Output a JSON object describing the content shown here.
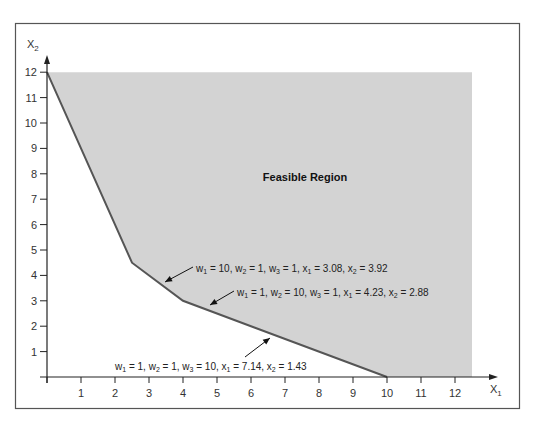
{
  "chart_data": {
    "type": "area",
    "title": "",
    "xlabel": "X1",
    "ylabel": "X2",
    "xlim": [
      0,
      12.5
    ],
    "ylim": [
      0,
      12
    ],
    "x_ticks": [
      1,
      2,
      3,
      4,
      5,
      6,
      7,
      8,
      9,
      10,
      11,
      12
    ],
    "y_ticks": [
      1,
      2,
      3,
      4,
      5,
      6,
      7,
      8,
      9,
      10,
      11,
      12
    ],
    "grid": false,
    "legend": null,
    "feasible_region": {
      "label": "Feasible Region",
      "boundary_vertices": [
        {
          "x": 0,
          "y": 12
        },
        {
          "x": 2.5,
          "y": 4.5
        },
        {
          "x": 4,
          "y": 3
        },
        {
          "x": 10,
          "y": 0
        }
      ],
      "extends_to": {
        "x_max": 12.5,
        "y_max": 12
      },
      "fill_color": "#d3d3d3",
      "boundary_color": "#555555"
    },
    "annotations": [
      {
        "text": "w1 = 10, w2 = 1, w3 = 1, x1 = 3.08, x2 = 3.92",
        "point": {
          "x": 3.08,
          "y": 3.92
        }
      },
      {
        "text": "w1 = 1, w2 = 10, w3 = 1, x1 = 4.23, x2 = 2.88",
        "point": {
          "x": 4.23,
          "y": 2.88
        }
      },
      {
        "text": "w1 = 1, w2 = 1, w3 = 10, x1 = 7.14, x2 = 1.43",
        "point": {
          "x": 7.14,
          "y": 1.43
        }
      }
    ]
  },
  "labels": {
    "x_axis": "X",
    "x_axis_sub": "1",
    "y_axis": "X",
    "y_axis_sub": "2",
    "region": "Feasible Region"
  }
}
